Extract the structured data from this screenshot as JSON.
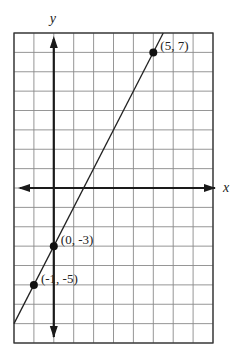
{
  "chart_data": {
    "type": "line",
    "title": "",
    "xlabel": "x",
    "ylabel": "y",
    "xlim": [
      -2,
      8
    ],
    "ylim": [
      -8,
      8
    ],
    "grid": true,
    "grid_step": 1,
    "series": [
      {
        "name": "y = 2x - 3",
        "slope": 2,
        "intercept": -3,
        "x": [
          -2,
          5.5
        ],
        "y": [
          -7,
          8
        ]
      }
    ],
    "points": [
      {
        "x": 5,
        "y": 7,
        "label": "(5, 7)"
      },
      {
        "x": 0,
        "y": -3,
        "label": "(0, -3)"
      },
      {
        "x": -1,
        "y": -5,
        "label": "(-1, -5)"
      }
    ]
  },
  "colors": {
    "grid": "#8a8a8a",
    "axis": "#1a1a1a",
    "line": "#222222",
    "point": "#111111"
  }
}
